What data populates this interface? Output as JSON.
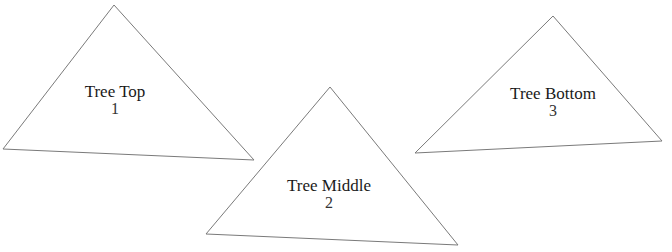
{
  "diagram": {
    "stroke_color": "#7a7a7a",
    "fill_color": "#ffffff",
    "nodes": [
      {
        "title": "Tree Top",
        "number": "1",
        "points": "114,5 3,149 254,160",
        "label_x": 115,
        "label_y": 83
      },
      {
        "title": "Tree Middle",
        "number": "2",
        "points": "330,87 206,234 458,245",
        "label_x": 329,
        "label_y": 177
      },
      {
        "title": "Tree Bottom",
        "number": "3",
        "points": "553,16 415,153 662,141",
        "label_x": 553,
        "label_y": 85
      }
    ]
  }
}
